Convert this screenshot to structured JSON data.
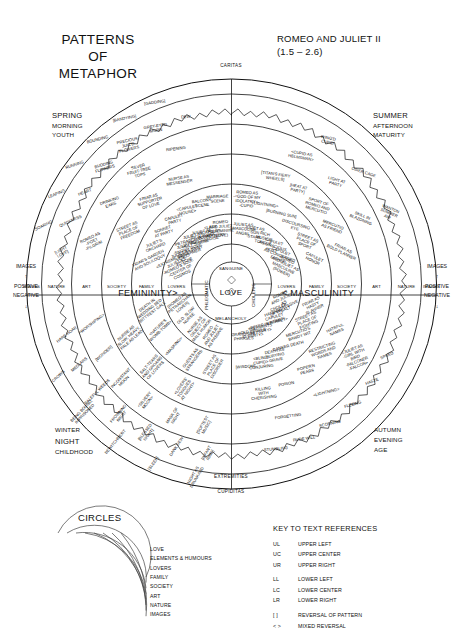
{
  "header": {
    "title_lines": [
      "PATTERNS",
      "OF",
      "METAPHOR"
    ],
    "work_title": "ROMEO AND JULIET II",
    "work_scenes": "(1.5 – 2.6)"
  },
  "corners": {
    "top_left": {
      "l1": "SPRING",
      "l2": "MORNING",
      "l3": "YOUTH"
    },
    "top_right": {
      "l1": "SUMMER",
      "l2": "AFTERNOON",
      "l3": "MATURITY"
    },
    "bottom_left": {
      "l1": "WINTER",
      "l2": "NIGHT",
      "l3": "CHILDHOOD"
    },
    "bottom_right": {
      "l1": "AUTUMN",
      "l2": "EVENING",
      "l3": "AGE"
    }
  },
  "poles": {
    "top": "CARITAS",
    "bottom_inner": "EXTREMITIES",
    "bottom": "CUPIDITAS",
    "left_axis": "FEMININITY>",
    "right_axis": "< MASCULINITY",
    "center": "LOVE"
  },
  "humours": {
    "top": "SANGUINE",
    "right": "CHOLERIC",
    "bottom": "MELANCHOLY",
    "left": "PHLEGMATIC"
  },
  "edge_scale": {
    "label": "IMAGES",
    "up_arrow": "↑",
    "positive": "POSITIVE",
    "negative": "NEGATIVE",
    "down_arrow": "↓"
  },
  "ring_axis_labels": [
    "LOVERS",
    "FAMILY",
    "SOCIETY",
    "ART",
    "NATURE",
    "IMAGES"
  ],
  "circles_legend": {
    "heading": "CIRCLES",
    "items": [
      "LOVE",
      "ELEMENTS & HUMOURS",
      "LOVERS",
      "FAMILY",
      "SOCIETY",
      "ART",
      "NATURE",
      "IMAGES"
    ]
  },
  "key_legend": {
    "heading": "KEY TO TEXT REFERENCES",
    "rows": [
      {
        "code": "UL",
        "desc": "UPPER LEFT"
      },
      {
        "code": "UC",
        "desc": "UPPER CENTER"
      },
      {
        "code": "UR",
        "desc": "UPPER RIGHT"
      },
      {
        "code": "LL",
        "desc": "LOWER LEFT"
      },
      {
        "code": "LC",
        "desc": "LOWER CENTER"
      },
      {
        "code": "LR",
        "desc": "LOWER RIGHT"
      },
      {
        "code": "[ ]",
        "desc": "REVERSAL OF PATTERN"
      },
      {
        "code": "< >",
        "desc": "MIXED REVERSAL"
      }
    ]
  },
  "chart_data": {
    "type": "radial-diagram",
    "center_value": "LOVE",
    "rings_outward": [
      "LOVE",
      "ELEMENTS & HUMOURS",
      "LOVERS",
      "FAMILY",
      "SOCIETY",
      "ART",
      "NATURE",
      "IMAGES"
    ],
    "quadrants": {
      "upper_left": "FEMININITY / CARITAS (SPRING MORNING YOUTH)",
      "upper_right": "MASCULINITY / CARITAS (SUMMER AFTERNOON MATURITY)",
      "lower_left": "FEMININITY / CUPIDITAS (WINTER NIGHT CHILDHOOD)",
      "lower_right": "MASCULINITY / CUPIDITAS (AUTUMN EVENING AGE)"
    },
    "segments": {
      "ul_lovers": [
        "<EXTREME SWEET>|JULIET AS|-ROMEO'S SOUL|-CENTER OF|COSMOS",
        "JULIET AS|-VENUS|-PSYCHE",
        "JULIET AS|-SNOWY DOVE|-GOSSAMER",
        "JULIET AS|-PETRARCHAN LADY|-HOLY SHRINE|-SAINT",
        "JULIET AS|-RICH JEWEL|-MERCHANDISE",
        "<LADY|CAPULET|AS MOTHER>",
        "ROMEO|AND JULIET|AS FEMININE|(LOVE)"
      ],
      "ul_family": [
        "FRIAR'S GARDEN|AND SOLILOQUY",
        "JULIET'S|ORCHARD",
        "SONNET|AT PARTY",
        "CAPULET|PARTY",
        "<CAPULET|HOUSE>",
        "BALCONY|SCENE",
        "MARRIAGE|SCENE"
      ],
      "ul_society": [
        "STREET AS|PLACE OF|FREEDOM",
        "FRIAR AS|SUPPORTER|OF LOVE",
        "NURSE AS|MESSENGER"
      ],
      "ul_art": [
        "ROMEO AS|-POET|-PILGRIM",
        "DRINKING|EARS",
        "SILVER|FRUIT-TREE|TOPS",
        "RIPENING"
      ],
      "ul_nature": [
        "[LIGHT|LOVE]",
        "QUICKNESS",
        "HEART",
        "BUDDING|FLOWERS",
        "PRECIOUS|JUIC'D|FLOWERS",
        "GREY-EYED|MORN",
        "DEW"
      ],
      "ul_images": [
        "SOARING",
        "LEAPING",
        "RUNNING",
        "BOUNDING",
        "[BANDYING]",
        "[GADDING]"
      ],
      "ur_lovers": [
        "JULIET AS|} MASCULINE|ANGEL",
        "JULIET AS|-SUN|-STARS",
        "RICH|MUSIC'S|TONGUE",
        "CAPULET|AS GRACIOUS|HOST",
        "CAPULET|AS CONCERNED|FATHER",
        "ROMEO|AND JULIET AS|MASCULINE|(POWER)"
      ],
      "ur_family": [
        "ROMEO AS|-<GOD OF MY|IDOLATRY>|-CUPID",
        "<LIGHTNING>",
        "[BURNING SUN]",
        "DISCOURSING|EYE",
        "STREET AS|PLACE OF|SPORT",
        "CAPULET|HONOR"
      ],
      "ur_society": [
        "[TITAN'S FIERY|WHEELS]",
        "[HEAT AT|PARTY]",
        "SPORT OF|ROMEO AND|MERCUTIO",
        "MERCUTIO|AS FRIEND",
        "FRIAR AS|BOLD PLANNER"
      ],
      "ur_art": [
        "<CUPID AS|HELMSMAN>",
        "LIGHT AT|PARTY",
        "SKILL IN|BLAZONING"
      ],
      "ur_nature": [
        "WING'D|CUPID",
        "OSIER CAGE",
        "WANTON|SUMMER|AIR"
      ],
      "ll_lovers": [
        "ROMEO|AND JULIET|AS PASSIVE",
        "NURSE AS|OBJECT OF|MALE HUMOR",
        "OLD, SLOW|NURSE",
        "[ROMEO AS|PETRARCHAN|LOVER]"
      ],
      "ll_family": [
        "STREET AS|PLACE OF|DISORDER",
        "GUESTS AS|STRANGERS",
        "<MASKING>",
        "<NATURE'S|WOMB-TOMB>",
        "DEATH IN|WEDDING BED|BITT'REST GALL"
      ],
      "ll_society": [
        "<LOVERS'|TONGUES|AT NIGHT>",
        "SALT-TEARS|AND GROANS|OF LOVERS",
        "NURSE AS|SLOW, HEAVY,|PALE AS LEAD"
      ],
      "ll_art": [
        "[SOFTEST|MUSIC]",
        "MASK OF|NIGHT",
        "<SILVERY|MOON>",
        "INCONSTANT|MOON",
        "[WONDER]",
        "<WORSHIPING>"
      ],
      "ll_nature": [
        "[INFANT|RIND]",
        "DANK DEW",
        "[BLESSED|NIGHT]",
        "FROWNING|NIGHT",
        "BALEFUL WEEDS",
        "MEDLARS",
        "HARE HOAR"
      ],
      "ll_images": [
        "NIGHT AS|DRUNKARD",
        "[SLEEP]",
        "BEWITCHMENT",
        "BEING BOUND,|IMPRISONED",
        "CROWS"
      ],
      "lr_lovers": [
        "ROMEO|AND JULIET|AS|AGGRESSIVE",
        "CHOLER|OF TYBALT",
        "HATE OF|CAPULET|KINSMEN",
        "<PETER IN STREET>",
        "<SERVANTS|AT PARTY>",
        "<OLD PEOPLE|AT PARTY>",
        "GRANDSIRE|PHRASES"
      ],
      "lr_family": [
        "FRIAR AS|HASTY|PLANNER",
        "STREET AS|PLACE OF|FIGHTING",
        "MERCUTIO'S|BAWDY WIT",
        "CANKER DEATH",
        "DEATH AS|BURYING|GRAVE",
        "<BLIND|CUPID>|CONJURING",
        "[WISDOM]"
      ],
      "lr_society": [
        "HATEFUL|NAMES",
        "RESTRICTING|WORDS AND|NAMES",
        "POPER'N|PEARS",
        "POISON",
        "KILLING|WITH|CHERISHING"
      ],
      "lr_art": [
        "<JULIET AS|-GIRL WITH|BIRD|-FALCONER|-FALCON>",
        "<LIGHTNING>",
        "FORGETTING"
      ],
      "lr_nature": [
        "SPEED",
        "HASTE",
        "FLEEING",
        "SCORNING",
        "RUDE WILL",
        "STUMBLING"
      ]
    }
  }
}
